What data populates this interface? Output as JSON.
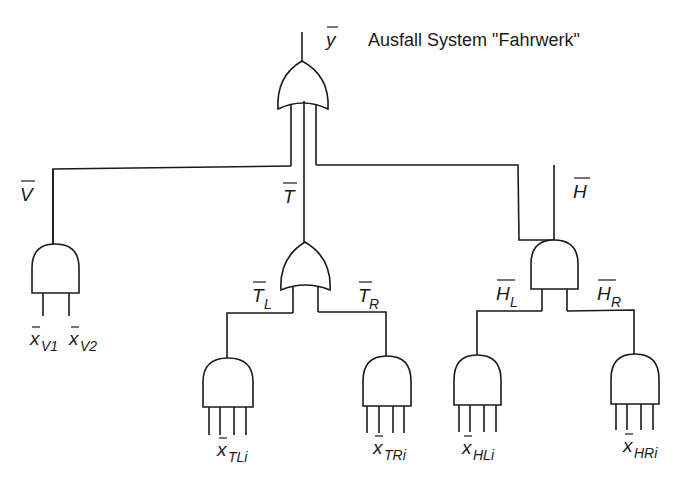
{
  "title": "Ausfall System \"Fahrwerk\"",
  "top_event": {
    "symbol": "y",
    "gate": "OR"
  },
  "branches": [
    {
      "id": "V",
      "label": "V",
      "gate": "AND",
      "inputs": [
        {
          "base": "x",
          "sub": "V1"
        },
        {
          "base": "x",
          "sub": "V2"
        }
      ]
    },
    {
      "id": "T",
      "label": "T",
      "gate": "OR",
      "children": [
        {
          "id": "TL",
          "label": "T",
          "sub": "L",
          "gate": "AND",
          "input": {
            "base": "x",
            "sub": "TLi"
          }
        },
        {
          "id": "TR",
          "label": "T",
          "sub": "R",
          "gate": "AND",
          "input": {
            "base": "x",
            "sub": "TRi"
          }
        }
      ]
    },
    {
      "id": "H",
      "label": "H",
      "gate": "AND",
      "children": [
        {
          "id": "HL",
          "label": "H",
          "sub": "L",
          "gate": "AND",
          "input": {
            "base": "x",
            "sub": "HLi"
          }
        },
        {
          "id": "HR",
          "label": "H",
          "sub": "R",
          "gate": "AND",
          "input": {
            "base": "x",
            "sub": "HRi"
          }
        }
      ]
    }
  ],
  "labels": {
    "y": "y",
    "V": "V",
    "T": "T",
    "H": "H",
    "TL_base": "T",
    "TL_sub": "L",
    "TR_base": "T",
    "TR_sub": "R",
    "HL_base": "H",
    "HL_sub": "L",
    "HR_base": "H",
    "HR_sub": "R",
    "xV1_base": "x",
    "xV1_sub": "V1",
    "xV2_base": "x",
    "xV2_sub": "V2",
    "xTLi_base": "x",
    "xTLi_sub": "TLi",
    "xTRi_base": "x",
    "xTRi_sub": "TRi",
    "xHLi_base": "x",
    "xHLi_sub": "HLi",
    "xHRi_base": "x",
    "xHRi_sub": "HRi"
  },
  "colors": {
    "line": "#1a1a1a",
    "background": "#ffffff"
  }
}
